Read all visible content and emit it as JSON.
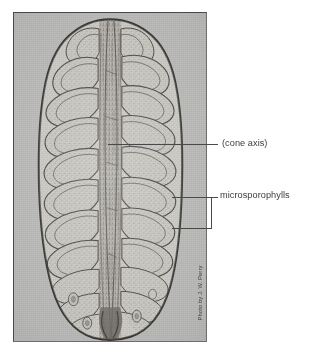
{
  "figure": {
    "caption_labels": [
      {
        "id": "cone-axis",
        "text": "(cone axis)"
      },
      {
        "id": "microsporophylls",
        "text": "microsporophylls"
      }
    ],
    "credit": "Photo by J. W. Perry",
    "plate": {
      "background_color": "#b9b9b7",
      "border_color": "#4a4a4a",
      "left": 13,
      "top": 12,
      "width": 194,
      "height": 330
    },
    "page_background": "#ffffff",
    "label_color": "#3d3d3d",
    "leader_color": "#4a4a4a",
    "annotations": {
      "cone_axis": {
        "label": "(cone axis)",
        "leader": {
          "x1": 108,
          "y1": 144,
          "x2": 218,
          "y2": 144
        },
        "points_to": "central vascular axis of the cone"
      },
      "microsporophylls": {
        "label": "microsporophylls",
        "bracket": {
          "top_y": 197,
          "bottom_y": 228,
          "vertical_x": 211,
          "tip_x": 172
        },
        "points_to": "spirally arranged scale-like microsporophylls bearing microsporangia"
      }
    }
  }
}
